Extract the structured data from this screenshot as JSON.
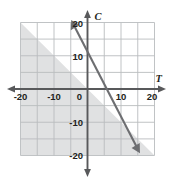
{
  "figure": {
    "name": "coordinate-plane-linear-inequality",
    "background_color": "#ffffff"
  },
  "chart_data": {
    "type": "line",
    "title": "",
    "subtitle": "",
    "xlabel": "T",
    "ylabel": "C",
    "xlim": [
      -20,
      20
    ],
    "ylim": [
      -20,
      20
    ],
    "grid": true,
    "grid_step": 5,
    "grid_color": "#b9bcbe",
    "axis_color": "#58595b",
    "legend": "none",
    "x_ticks": [
      -20,
      -10,
      0,
      10,
      20
    ],
    "x_tick_labels": [
      "-20",
      "-10",
      "0",
      "10",
      "20"
    ],
    "y_ticks": [
      -20,
      -10,
      10,
      20
    ],
    "y_tick_labels": [
      "-20",
      "-10",
      "10",
      "20"
    ],
    "origin_label": "0",
    "series": [
      {
        "name": "boundary-line",
        "type": "line",
        "style": "solid",
        "color": "#6d6e71",
        "arrow_start": true,
        "arrow_end": true,
        "y_intercept": 12,
        "x_intercept": 6.5,
        "slope": -1.85,
        "points": [
          {
            "x": -4.3,
            "y": 20
          },
          {
            "x": 0,
            "y": 12
          },
          {
            "x": 6.5,
            "y": 0
          },
          {
            "x": 15.0,
            "y": -15.7
          }
        ]
      }
    ],
    "shaded_region": {
      "name": "solution-region",
      "description": "region on or below the boundary line within the grid",
      "fill_color": "#e0e1e2",
      "relation": "less-than-or-equal"
    },
    "annotations": []
  },
  "axes_labels": {
    "x_axis_name": "T",
    "y_axis_name": "C"
  }
}
